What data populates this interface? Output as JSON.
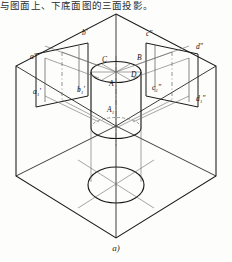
{
  "header": {
    "text": "与图面上、下底面图的三面投影。"
  },
  "figure": {
    "caption": "a)",
    "stroke": "#1a1a1a",
    "thin_stroke": "#555555",
    "dash_stroke": "#666666",
    "labels": [
      {
        "id": "a-prime",
        "text": "a'",
        "x": 30,
        "y": 59
      },
      {
        "id": "b-prime",
        "text": "b'",
        "x": 82,
        "y": 35
      },
      {
        "id": "c-dprime",
        "text": "c″",
        "x": 146,
        "y": 36
      },
      {
        "id": "d-dprime",
        "text": "d″",
        "x": 196,
        "y": 49
      },
      {
        "id": "a1-prime",
        "text": "a₁'",
        "x": 33,
        "y": 94
      },
      {
        "id": "b1-prime",
        "text": "b₁'",
        "x": 77,
        "y": 92
      },
      {
        "id": "c1-dprime",
        "text": "c₁″",
        "x": 152,
        "y": 90
      },
      {
        "id": "d1-dprime",
        "text": "d₁″",
        "x": 196,
        "y": 101
      },
      {
        "id": "point-C",
        "text": "C",
        "x": 102,
        "y": 62
      },
      {
        "id": "point-B",
        "text": "B",
        "x": 137,
        "y": 60
      },
      {
        "id": "point-D",
        "text": "D",
        "x": 131,
        "y": 77
      },
      {
        "id": "point-A",
        "text": "A",
        "x": 109,
        "y": 86
      },
      {
        "id": "point-A1",
        "text": "A₁",
        "x": 107,
        "y": 112
      }
    ]
  }
}
